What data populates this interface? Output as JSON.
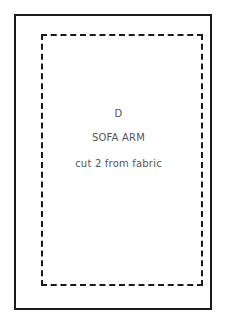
{
  "pattern_piece": {
    "letter": "D",
    "name": "SOFA ARM",
    "instruction": "cut 2 from fabric"
  }
}
